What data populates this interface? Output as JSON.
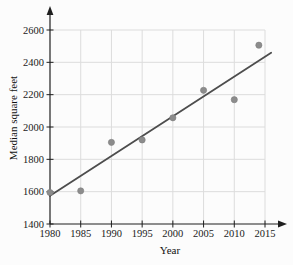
{
  "chart_data": {
    "type": "scatter",
    "title": "",
    "xlabel": "Year",
    "ylabel": "Median square feet",
    "x_ticks": [
      1980,
      1985,
      1990,
      1995,
      2000,
      2005,
      2010,
      2015
    ],
    "y_ticks": [
      1400,
      1600,
      1800,
      2000,
      2200,
      2400,
      2600
    ],
    "xlim": [
      1980,
      2015
    ],
    "ylim": [
      1400,
      2600
    ],
    "grid": true,
    "legend": false,
    "points": [
      {
        "year": 1980,
        "sqft": 1595
      },
      {
        "year": 1985,
        "sqft": 1605
      },
      {
        "year": 1990,
        "sqft": 1905
      },
      {
        "year": 1995,
        "sqft": 1920
      },
      {
        "year": 2000,
        "sqft": 2057
      },
      {
        "year": 2005,
        "sqft": 2227
      },
      {
        "year": 2010,
        "sqft": 2169
      },
      {
        "year": 2014,
        "sqft": 2506
      }
    ],
    "trend_line": {
      "start": {
        "year": 1980,
        "sqft": 1575
      },
      "end": {
        "year": 2016,
        "sqft": 2460
      }
    },
    "colors": {
      "point": "#8c8c8c",
      "point_edge": "#7d7d7d",
      "trend_line": "#4d4d4d",
      "axis": "#1f1f1f",
      "grid": "#dcdcdc",
      "tick_label": "#1a1a1a",
      "axis_title": "#111111",
      "background": "#fcfcfc"
    }
  }
}
